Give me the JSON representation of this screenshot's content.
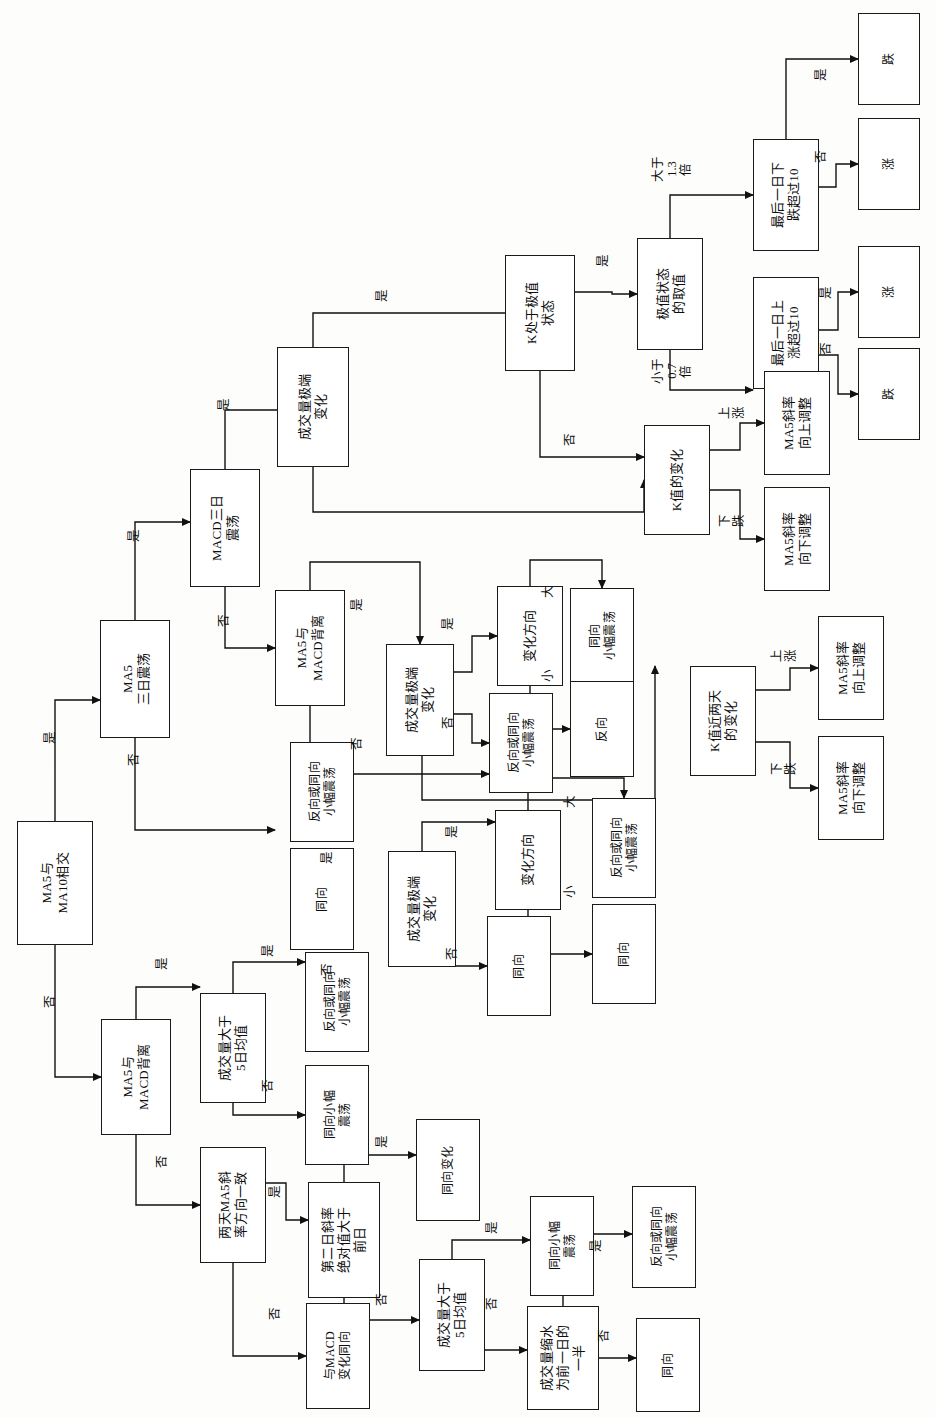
{
  "diagram": {
    "orientation": "rotated-90-ccw",
    "nodes": [
      {
        "id": "n1",
        "label": "MA5与\nMA10相交",
        "x": 17,
        "y": 821,
        "w": 76,
        "h": 124
      },
      {
        "id": "n2",
        "label": "MA5\n三日震荡",
        "x": 100,
        "y": 620,
        "w": 70,
        "h": 118
      },
      {
        "id": "n3",
        "label": "MACD三日\n震荡",
        "x": 190,
        "y": 469,
        "w": 70,
        "h": 118
      },
      {
        "id": "n4",
        "label": "成交量极端\n变化",
        "x": 277,
        "y": 347,
        "w": 72,
        "h": 120
      },
      {
        "id": "n5",
        "label": "K处于极值\n状态",
        "x": 505,
        "y": 255,
        "w": 70,
        "h": 116
      },
      {
        "id": "n6",
        "label": "极值状态\n的取值",
        "x": 637,
        "y": 238,
        "w": 66,
        "h": 112
      },
      {
        "id": "n7",
        "label": "最后一日下\n跌超过10",
        "x": 753,
        "y": 139,
        "w": 66,
        "h": 112
      },
      {
        "id": "n8",
        "label": "跌",
        "x": 858,
        "y": 13,
        "w": 62,
        "h": 92
      },
      {
        "id": "n9",
        "label": "涨",
        "x": 858,
        "y": 118,
        "w": 62,
        "h": 92
      },
      {
        "id": "n10",
        "label": "最后一日上\n涨超过10",
        "x": 753,
        "y": 277,
        "w": 66,
        "h": 112
      },
      {
        "id": "n11",
        "label": "涨",
        "x": 858,
        "y": 246,
        "w": 62,
        "h": 92
      },
      {
        "id": "n12",
        "label": "跌",
        "x": 858,
        "y": 348,
        "w": 62,
        "h": 92
      },
      {
        "id": "n13",
        "label": "K值的变化",
        "x": 644,
        "y": 425,
        "w": 66,
        "h": 110
      },
      {
        "id": "n14",
        "label": "MA5斜率\n向上调整",
        "x": 764,
        "y": 371,
        "w": 66,
        "h": 104
      },
      {
        "id": "n15",
        "label": "MA5斜率\n向下调整",
        "x": 764,
        "y": 487,
        "w": 66,
        "h": 104
      },
      {
        "id": "n16",
        "label": "MA5与\nMACD背离",
        "x": 275,
        "y": 590,
        "w": 70,
        "h": 116
      },
      {
        "id": "n17",
        "label": "成交量极端\n变化",
        "x": 386,
        "y": 644,
        "w": 68,
        "h": 112
      },
      {
        "id": "n18",
        "label": "变化方向",
        "x": 497,
        "y": 586,
        "w": 66,
        "h": 100
      },
      {
        "id": "n19",
        "label": "同向\n小幅震荡",
        "x": 570,
        "y": 588,
        "w": 64,
        "h": 96
      },
      {
        "id": "n20",
        "label": "反向",
        "x": 570,
        "y": 681,
        "w": 64,
        "h": 96
      },
      {
        "id": "n21",
        "label": "反向或同向\n小幅震荡",
        "x": 489,
        "y": 693,
        "w": 64,
        "h": 100
      },
      {
        "id": "n22",
        "label": "反向或同向\n小幅震荡",
        "x": 290,
        "y": 742,
        "w": 64,
        "h": 100
      },
      {
        "id": "n23",
        "label": "同向",
        "x": 290,
        "y": 848,
        "w": 64,
        "h": 102
      },
      {
        "id": "n24",
        "label": "成交量极端\n变化",
        "x": 388,
        "y": 851,
        "w": 68,
        "h": 116
      },
      {
        "id": "n25",
        "label": "变化方向",
        "x": 495,
        "y": 810,
        "w": 66,
        "h": 100
      },
      {
        "id": "n26",
        "label": "反向或同向\n小幅震荡",
        "x": 592,
        "y": 798,
        "w": 64,
        "h": 100
      },
      {
        "id": "n27",
        "label": "同向",
        "x": 592,
        "y": 904,
        "w": 64,
        "h": 100
      },
      {
        "id": "n28",
        "label": "同向",
        "x": 487,
        "y": 916,
        "w": 64,
        "h": 100
      },
      {
        "id": "n29",
        "label": "K值近两天\n的变化",
        "x": 690,
        "y": 666,
        "w": 66,
        "h": 110
      },
      {
        "id": "n30",
        "label": "MA5斜率\n向上调整",
        "x": 818,
        "y": 616,
        "w": 66,
        "h": 104
      },
      {
        "id": "n31",
        "label": "MA5斜率\n向下调整",
        "x": 818,
        "y": 736,
        "w": 66,
        "h": 104
      },
      {
        "id": "n32",
        "label": "MA5与\nMACD背离",
        "x": 101,
        "y": 1019,
        "w": 70,
        "h": 116
      },
      {
        "id": "n33",
        "label": "成交量大于\n5日均值",
        "x": 200,
        "y": 993,
        "w": 66,
        "h": 110
      },
      {
        "id": "n34",
        "label": "反向或同向\n小幅震荡",
        "x": 305,
        "y": 952,
        "w": 64,
        "h": 100
      },
      {
        "id": "n35",
        "label": "同向小幅\n震荡",
        "x": 305,
        "y": 1065,
        "w": 64,
        "h": 100
      },
      {
        "id": "n36",
        "label": "两天MA5斜\n率方向一致",
        "x": 200,
        "y": 1147,
        "w": 66,
        "h": 116
      },
      {
        "id": "n37",
        "label": "第二日斜率\n绝对值大于\n前日",
        "x": 308,
        "y": 1182,
        "w": 72,
        "h": 116
      },
      {
        "id": "n38",
        "label": "同向变化",
        "x": 416,
        "y": 1119,
        "w": 64,
        "h": 102
      },
      {
        "id": "n39",
        "label": "与MACD\n变化同向",
        "x": 306,
        "y": 1303,
        "w": 64,
        "h": 106
      },
      {
        "id": "n40",
        "label": "成交量大于\n5日均值",
        "x": 419,
        "y": 1259,
        "w": 66,
        "h": 112
      },
      {
        "id": "n41",
        "label": "同向小幅\n震荡",
        "x": 530,
        "y": 1196,
        "w": 64,
        "h": 100
      },
      {
        "id": "n42",
        "label": "成交量缩水\n为前一日的\n一半",
        "x": 527,
        "y": 1306,
        "w": 72,
        "h": 104
      },
      {
        "id": "n43",
        "label": "反向或同向\n小幅震荡",
        "x": 632,
        "y": 1186,
        "w": 64,
        "h": 102
      },
      {
        "id": "n44",
        "label": "同向",
        "x": 636,
        "y": 1318,
        "w": 64,
        "h": 94
      }
    ],
    "edge_labels": [
      {
        "id": "e1",
        "text": "是",
        "x": 50,
        "y": 742
      },
      {
        "id": "e2",
        "text": "否",
        "x": 50,
        "y": 1006
      },
      {
        "id": "e3",
        "text": "是",
        "x": 134,
        "y": 540
      },
      {
        "id": "e4",
        "text": "否",
        "x": 134,
        "y": 764
      },
      {
        "id": "e5",
        "text": "是",
        "x": 224,
        "y": 409
      },
      {
        "id": "e6",
        "text": "否",
        "x": 224,
        "y": 625
      },
      {
        "id": "e7",
        "text": "是",
        "x": 382,
        "y": 300
      },
      {
        "id": "e8",
        "text": "否",
        "x": 570,
        "y": 444
      },
      {
        "id": "e9",
        "text": "是",
        "x": 603,
        "y": 265
      },
      {
        "id": "e10",
        "text": "大于\n1.3\n倍",
        "x": 672,
        "y": 160
      },
      {
        "id": "e11",
        "text": "小于\n0.7\n倍",
        "x": 672,
        "y": 362
      },
      {
        "id": "e12",
        "text": "是",
        "x": 821,
        "y": 79
      },
      {
        "id": "e13",
        "text": "否",
        "x": 821,
        "y": 161
      },
      {
        "id": "e14",
        "text": "是",
        "x": 826,
        "y": 297
      },
      {
        "id": "e15",
        "text": "否",
        "x": 826,
        "y": 353
      },
      {
        "id": "e16",
        "text": "上\n涨",
        "x": 732,
        "y": 410
      },
      {
        "id": "e17",
        "text": "下\n跌",
        "x": 732,
        "y": 518
      },
      {
        "id": "e18",
        "text": "是",
        "x": 357,
        "y": 609
      },
      {
        "id": "e19",
        "text": "否",
        "x": 357,
        "y": 748
      },
      {
        "id": "e20",
        "text": "是",
        "x": 448,
        "y": 628
      },
      {
        "id": "e21",
        "text": "否",
        "x": 448,
        "y": 727
      },
      {
        "id": "e22",
        "text": "大",
        "x": 548,
        "y": 596
      },
      {
        "id": "e23",
        "text": "小",
        "x": 548,
        "y": 680
      },
      {
        "id": "e24",
        "text": "是",
        "x": 327,
        "y": 862
      },
      {
        "id": "e25",
        "text": "否",
        "x": 327,
        "y": 974
      },
      {
        "id": "e26",
        "text": "是",
        "x": 452,
        "y": 836
      },
      {
        "id": "e27",
        "text": "否",
        "x": 452,
        "y": 958
      },
      {
        "id": "e28",
        "text": "大",
        "x": 570,
        "y": 806
      },
      {
        "id": "e29",
        "text": "小",
        "x": 570,
        "y": 896
      },
      {
        "id": "e30",
        "text": "上\n涨",
        "x": 784,
        "y": 653
      },
      {
        "id": "e31",
        "text": "下\n跌",
        "x": 784,
        "y": 766
      },
      {
        "id": "e32",
        "text": "是",
        "x": 162,
        "y": 968
      },
      {
        "id": "e33",
        "text": "否",
        "x": 162,
        "y": 1166
      },
      {
        "id": "e34",
        "text": "是",
        "x": 268,
        "y": 955
      },
      {
        "id": "e35",
        "text": "否",
        "x": 268,
        "y": 1090
      },
      {
        "id": "e36",
        "text": "是",
        "x": 275,
        "y": 1196
      },
      {
        "id": "e37",
        "text": "否",
        "x": 275,
        "y": 1318
      },
      {
        "id": "e38",
        "text": "是",
        "x": 382,
        "y": 1146
      },
      {
        "id": "e39",
        "text": "否",
        "x": 382,
        "y": 1304
      },
      {
        "id": "e40",
        "text": "是",
        "x": 492,
        "y": 1232
      },
      {
        "id": "e41",
        "text": "否",
        "x": 492,
        "y": 1308
      },
      {
        "id": "e42",
        "text": "是",
        "x": 596,
        "y": 1250
      },
      {
        "id": "e43",
        "text": "否",
        "x": 604,
        "y": 1340
      }
    ],
    "wires": [
      {
        "id": "w1",
        "d": "M 55 821 L 55 771",
        "arrow": false
      },
      {
        "id": "w2",
        "d": "M 55 771 L 55 700 L 100 700",
        "arrow": true
      },
      {
        "id": "w3",
        "d": "M 55 945 L 55 1077 L 101 1077",
        "arrow": true
      },
      {
        "id": "w4",
        "d": "M 135 620 L 135 522 L 190 522",
        "arrow": true
      },
      {
        "id": "w5",
        "d": "M 135 738 L 135 830 L 275 830",
        "arrow": true
      },
      {
        "id": "w6",
        "d": "M 225 469 L 225 410 L 313 410",
        "arrow": true
      },
      {
        "id": "w7",
        "d": "M 225 587 L 225 648 L 275 648",
        "arrow": true
      },
      {
        "id": "w8",
        "d": "M 313 347 L 313 313 L 540 313",
        "arrow": true
      },
      {
        "id": "w9",
        "d": "M 313 467 L 313 512 L 644 512 L 644 480",
        "arrow": true
      },
      {
        "id": "w10",
        "d": "M 575 292 L 612 292 L 612 294 L 637 294",
        "arrow": true
      },
      {
        "id": "w11",
        "d": "M 540 371 L 540 457 L 644 457",
        "arrow": true
      },
      {
        "id": "w12",
        "d": "M 670 238 L 670 195 L 753 195",
        "arrow": true
      },
      {
        "id": "w13",
        "d": "M 670 350 L 670 390 L 753 390",
        "arrow": true
      },
      {
        "id": "w14",
        "d": "M 786 139 L 786 59 L 858 59",
        "arrow": true
      },
      {
        "id": "w15",
        "d": "M 819 187 L 836 187 L 836 164 L 858 164",
        "arrow": true
      },
      {
        "id": "w16",
        "d": "M 819 330 L 838 330 L 838 292 L 858 292",
        "arrow": true
      },
      {
        "id": "w17",
        "d": "M 819 355 L 838 355 L 838 394 L 858 394",
        "arrow": true
      },
      {
        "id": "w18",
        "d": "M 710 450 L 740 450 L 740 423 L 764 423",
        "arrow": true
      },
      {
        "id": "w19",
        "d": "M 710 490 L 740 490 L 740 539 L 764 539",
        "arrow": true
      },
      {
        "id": "w20",
        "d": "M 310 590 L 310 562 L 420 562 L 420 644",
        "arrow": true
      },
      {
        "id": "w21",
        "d": "M 310 706 L 310 774 L 489 774",
        "arrow": true
      },
      {
        "id": "w22",
        "d": "M 454 672 L 472 672 L 472 636 L 497 636",
        "arrow": true
      },
      {
        "id": "w23",
        "d": "M 454 714 L 472 714 L 472 743 L 489 743",
        "arrow": true
      },
      {
        "id": "w24",
        "d": "M 530 586 L 530 560 L 602 560 L 602 588",
        "arrow": true
      },
      {
        "id": "w25",
        "d": "M 530 686 L 530 729 L 570 729",
        "arrow": true
      },
      {
        "id": "w26",
        "d": "M 422 756 L 422 800 L 655 800 L 655 666",
        "arrow": true
      },
      {
        "id": "w27",
        "d": "M 422 851 L 422 822 L 495 822",
        "arrow": true
      },
      {
        "id": "w28",
        "d": "M 422 967 L 422 966 L 487 966",
        "arrow": true
      },
      {
        "id": "w29",
        "d": "M 528 810 L 528 778 L 624 778 L 624 798",
        "arrow": true
      },
      {
        "id": "w30",
        "d": "M 528 910 L 528 954 L 592 954",
        "arrow": true
      },
      {
        "id": "w31",
        "d": "M 756 690 L 790 690 L 790 668 L 818 668",
        "arrow": true
      },
      {
        "id": "w32",
        "d": "M 756 742 L 790 742 L 790 788 L 818 788",
        "arrow": true
      },
      {
        "id": "w33",
        "d": "M 136 1019 L 136 987 L 200 987",
        "arrow": true
      },
      {
        "id": "w34",
        "d": "M 136 1135 L 136 1205 L 200 1205",
        "arrow": true
      },
      {
        "id": "w35",
        "d": "M 233 993 L 233 962 L 305 962",
        "arrow": true
      },
      {
        "id": "w36",
        "d": "M 233 1103 L 233 1115 L 305 1115",
        "arrow": true
      },
      {
        "id": "w37",
        "d": "M 266 1183 L 286 1183 L 286 1220 L 308 1220",
        "arrow": true
      },
      {
        "id": "w38",
        "d": "M 233 1263 L 233 1356 L 306 1356",
        "arrow": true
      },
      {
        "id": "w39",
        "d": "M 344 1182 L 344 1155 L 416 1155",
        "arrow": true
      },
      {
        "id": "w40",
        "d": "M 344 1298 L 344 1320 L 419 1320",
        "arrow": true
      },
      {
        "id": "w41",
        "d": "M 452 1259 L 452 1240 L 530 1240",
        "arrow": true
      },
      {
        "id": "w42",
        "d": "M 452 1371 L 452 1350 L 527 1350",
        "arrow": true
      },
      {
        "id": "w43",
        "d": "M 563 1306 L 563 1234 L 632 1234",
        "arrow": true
      },
      {
        "id": "w44",
        "d": "M 599 1358 L 636 1358",
        "arrow": true
      }
    ]
  }
}
